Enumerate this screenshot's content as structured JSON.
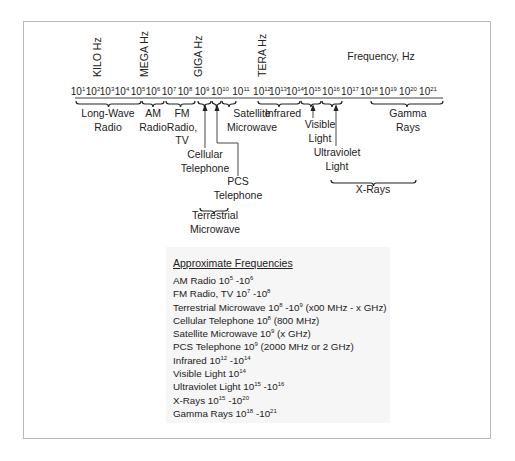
{
  "diagram": {
    "axis_title": "Frequency, Hz",
    "unit_labels": [
      {
        "label": "KILO Hz",
        "x": 101
      },
      {
        "label": "MEGA Hz",
        "x": 148
      },
      {
        "label": "GIGA Hz",
        "x": 202
      },
      {
        "label": "TERA Hz",
        "x": 266
      }
    ],
    "ticks": [
      {
        "base": "10",
        "exp": "1",
        "x": 82
      },
      {
        "base": "10",
        "exp": "2",
        "x": 97
      },
      {
        "base": "10",
        "exp": "3",
        "x": 111
      },
      {
        "base": "10",
        "exp": "4",
        "x": 126
      },
      {
        "base": "10",
        "exp": "5",
        "x": 142
      },
      {
        "base": "10",
        "exp": "6",
        "x": 157
      },
      {
        "base": "10",
        "exp": "7",
        "x": 173
      },
      {
        "base": "10",
        "exp": "8",
        "x": 189
      },
      {
        "base": "10",
        "exp": "9",
        "x": 206
      },
      {
        "base": "10",
        "exp": "10",
        "x": 224
      },
      {
        "base": "10",
        "exp": "11",
        "x": 245
      },
      {
        "base": "10",
        "exp": "12",
        "x": 266
      },
      {
        "base": "10",
        "exp": "13",
        "x": 282
      },
      {
        "base": "10",
        "exp": "14",
        "x": 299
      },
      {
        "base": "10",
        "exp": "15",
        "x": 316
      },
      {
        "base": "10",
        "exp": "16",
        "x": 335
      },
      {
        "base": "10",
        "exp": "17",
        "x": 354
      },
      {
        "base": "10",
        "exp": "18",
        "x": 373
      },
      {
        "base": "10",
        "exp": "19",
        "x": 392
      },
      {
        "base": "10",
        "exp": "20",
        "x": 412
      },
      {
        "base": "10",
        "exp": "21",
        "x": 432
      }
    ],
    "bands": [
      {
        "lines": [
          "Long-Wave",
          "Radio"
        ],
        "x1": 76,
        "x2": 141,
        "lx": 108,
        "ly": 117
      },
      {
        "lines": [
          "AM",
          "Radio"
        ],
        "x1": 142,
        "x2": 164,
        "lx": 153,
        "ly": 117
      },
      {
        "lines": [
          "FM",
          "Radio,",
          "TV"
        ],
        "x1": 166,
        "x2": 195,
        "lx": 182,
        "ly": 117
      },
      {
        "lines": [
          "Satellite",
          "Microwave"
        ],
        "x1": 222,
        "x2": 236,
        "lx": 252,
        "ly": 117
      },
      {
        "lines": [
          "Infrared"
        ],
        "x1": 258,
        "x2": 300,
        "lx": 283,
        "ly": 117
      },
      {
        "lines": [
          "Gamma",
          "Rays"
        ],
        "x1": 371,
        "x2": 443,
        "lx": 408,
        "ly": 117
      }
    ],
    "markers": [
      {
        "lines": [
          "Cellular",
          "Telephone"
        ],
        "x": 205,
        "lx": 205,
        "ly": 158
      },
      {
        "lines": [
          "PCS",
          "Telephone"
        ],
        "x": 217,
        "lx": 238,
        "ly": 185
      },
      {
        "lines": [
          "Visible",
          "Light"
        ],
        "x": 313,
        "lx": 320,
        "ly": 128
      },
      {
        "lines": [
          "Ultraviolet",
          "Light"
        ],
        "x": 336,
        "lx": 337,
        "ly": 156
      }
    ],
    "lower_brackets": [
      {
        "lines": [
          "Terrestrial",
          "Microwave"
        ],
        "x1": 200,
        "x2": 228,
        "y": 208,
        "lx": 215,
        "ly": 219
      },
      {
        "lines": [
          "X-Rays"
        ],
        "x1": 331,
        "x2": 416,
        "y": 180,
        "lx": 373,
        "ly": 193
      }
    ]
  },
  "legend": {
    "title": "Approximate Frequencies",
    "rows": [
      {
        "parts": [
          [
            "t",
            "AM Radio 10"
          ],
          [
            "s",
            "5"
          ],
          [
            "t",
            " -10"
          ],
          [
            "s",
            "6"
          ]
        ]
      },
      {
        "parts": [
          [
            "t",
            "FM Radio, TV 10"
          ],
          [
            "s",
            "7"
          ],
          [
            "t",
            " -10"
          ],
          [
            "s",
            "8"
          ]
        ]
      },
      {
        "parts": [
          [
            "t",
            "Terrestrial Microwave 10"
          ],
          [
            "s",
            "8"
          ],
          [
            "t",
            " -10"
          ],
          [
            "s",
            "9"
          ],
          [
            "t",
            " (x00 MHz - x GHz)"
          ]
        ]
      },
      {
        "parts": [
          [
            "t",
            "Cellular Telephone 10"
          ],
          [
            "s",
            "8"
          ],
          [
            "t",
            " (800 MHz)"
          ]
        ]
      },
      {
        "parts": [
          [
            "t",
            "Satellite Microwave 10"
          ],
          [
            "s",
            "9"
          ],
          [
            "t",
            " (x GHz)"
          ]
        ]
      },
      {
        "parts": [
          [
            "t",
            "PCS Telephone 10"
          ],
          [
            "s",
            "9"
          ],
          [
            "t",
            "  (2000 MHz or 2 GHz)"
          ]
        ]
      },
      {
        "parts": [
          [
            "t",
            "Infrared 10"
          ],
          [
            "s",
            "12"
          ],
          [
            "t",
            " -10"
          ],
          [
            "s",
            "14"
          ]
        ]
      },
      {
        "parts": [
          [
            "t",
            "Visible Light 10"
          ],
          [
            "s",
            "14"
          ]
        ]
      },
      {
        "parts": [
          [
            "t",
            "Ultraviolet Light 10"
          ],
          [
            "s",
            "15"
          ],
          [
            "t",
            " -10"
          ],
          [
            "s",
            "16"
          ]
        ]
      },
      {
        "parts": [
          [
            "t",
            "X-Rays 10"
          ],
          [
            "s",
            "15"
          ],
          [
            "t",
            " -10"
          ],
          [
            "s",
            "20"
          ]
        ]
      },
      {
        "parts": [
          [
            "t",
            "Gamma Rays 10"
          ],
          [
            "s",
            "18"
          ],
          [
            "t",
            " -10"
          ],
          [
            "s",
            "21"
          ]
        ]
      }
    ]
  },
  "colors": {
    "ink": "#222222",
    "frame": "#b9b9b9",
    "legend_bg": "#f6f6f6"
  }
}
